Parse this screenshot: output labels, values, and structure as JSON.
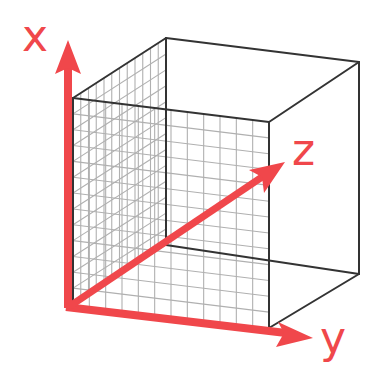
{
  "diagram": {
    "axes": [
      {
        "name": "x",
        "label": "x",
        "direction": "up"
      },
      {
        "name": "y",
        "label": "y",
        "direction": "right"
      },
      {
        "name": "z",
        "label": "z",
        "direction": "diagonal-depth"
      }
    ],
    "colors": {
      "axis": "#f0474b",
      "edge": "#333333",
      "grid": "#b0b0b0",
      "background": "#ffffff"
    },
    "cube": {
      "front_face_grid": {
        "columns": 12,
        "rows": 13
      },
      "side_face_grid": {
        "columns": 12,
        "rows": 13
      }
    }
  }
}
